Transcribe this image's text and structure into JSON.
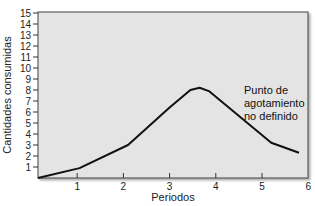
{
  "chart_data": {
    "type": "line",
    "title": "",
    "xlabel": "Periodos",
    "ylabel": "Cantidades consumidas",
    "xlim": [
      0,
      6
    ],
    "ylim": [
      0,
      15
    ],
    "x_ticks": [
      "1",
      "2",
      "3",
      "4",
      "5",
      "6"
    ],
    "y_ticks": [
      "1",
      "2",
      "3",
      "4",
      "5",
      "6",
      "7",
      "8",
      "9",
      "10",
      "11",
      "12",
      "13",
      "14",
      "15"
    ],
    "grid": false,
    "series": [
      {
        "name": "Consumo",
        "x": [
          0.15,
          1.05,
          2.1,
          3.0,
          3.45,
          3.65,
          3.85,
          5.2,
          5.8
        ],
        "values": [
          0,
          0.9,
          3.0,
          6.4,
          8.0,
          8.2,
          7.9,
          3.2,
          2.3
        ]
      }
    ],
    "annotations": [
      {
        "text": [
          "Punto de",
          "agotamiento",
          "no definido"
        ],
        "x": 4.7,
        "y": 8.3
      }
    ],
    "legend": null
  },
  "colors": {
    "plot_bg": "#e4e4e4",
    "line": "#111111",
    "frame": "#333333"
  }
}
